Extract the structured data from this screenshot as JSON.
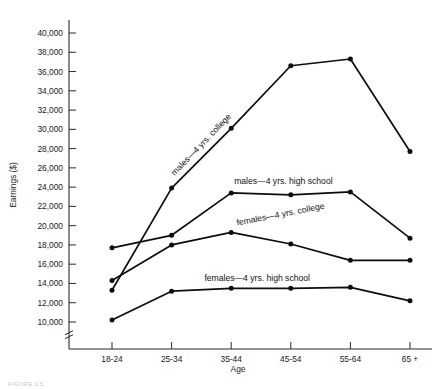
{
  "chart_data": {
    "type": "line",
    "title": "",
    "xlabel": "Age",
    "ylabel": "Earnings ($)",
    "categories": [
      "18-24",
      "25-34",
      "35-44",
      "45-54",
      "55-64",
      "65 +"
    ],
    "ylim": [
      8000,
      41000
    ],
    "yticks": [
      10000,
      12000,
      14000,
      16000,
      18000,
      20000,
      22000,
      24000,
      26000,
      28000,
      30000,
      32000,
      34000,
      36000,
      38000,
      40000
    ],
    "ytick_labels": [
      "10,000",
      "12,000",
      "14,000",
      "16,000",
      "18,000",
      "20,000",
      "22,000",
      "24,000",
      "26,000",
      "28,000",
      "30,000",
      "32,000",
      "34,000",
      "36,000",
      "38,000",
      "40,000"
    ],
    "axis_break": true,
    "grid": false,
    "legend": "inline-labels",
    "series": [
      {
        "name": "males—4 yrs. college",
        "label": "males—4 yrs. college",
        "label_rotation": -46,
        "values": [
          13300,
          23900,
          30100,
          36600,
          37300,
          27700
        ]
      },
      {
        "name": "males—4 yrs. high school",
        "label": "males—4 yrs. high school",
        "label_rotation": 0,
        "values": [
          17700,
          19000,
          23400,
          23200,
          23500,
          18700
        ]
      },
      {
        "name": "females—4 yrs. college",
        "label": "females—4 yrs. college",
        "label_rotation": -11,
        "values": [
          14300,
          18000,
          19300,
          18100,
          16400,
          16400
        ]
      },
      {
        "name": "females—4 yrs. high school",
        "label": "females—4 yrs. high school",
        "label_rotation": 0,
        "values": [
          10200,
          13200,
          13500,
          13500,
          13600,
          12200
        ]
      }
    ]
  },
  "caption": {
    "text": "FIGURE 3.5"
  }
}
